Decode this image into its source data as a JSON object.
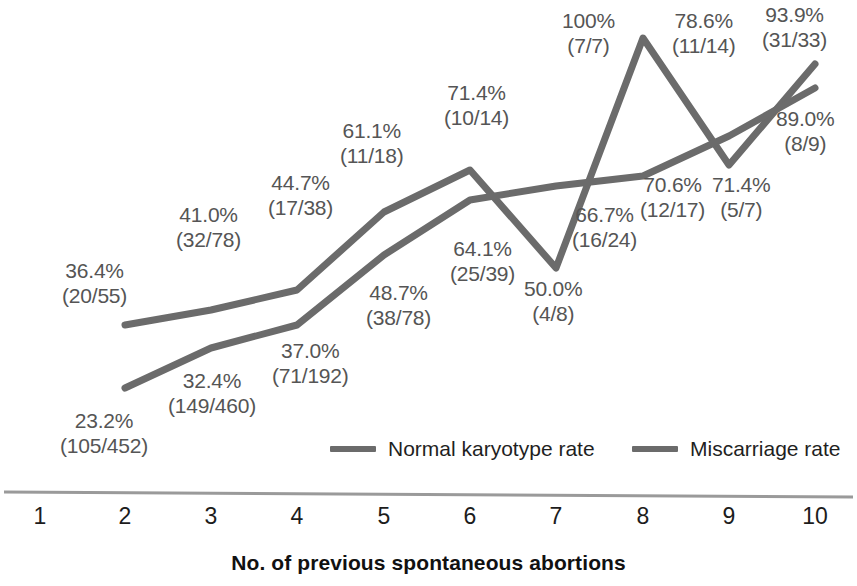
{
  "chart_data": {
    "type": "line",
    "title": "",
    "xlabel": "No. of previous spontaneous abortions",
    "ylabel": "",
    "grid": false,
    "legend_position": "bottom-center",
    "x": [
      1,
      2,
      3,
      4,
      5,
      6,
      7,
      8,
      9,
      10
    ],
    "xtick_labels": [
      "1",
      "2",
      "3",
      "4",
      "5",
      "6",
      "7",
      "8",
      "9",
      "10"
    ],
    "xlim": [
      1,
      10
    ],
    "ylim": [
      0,
      100
    ],
    "series": [
      {
        "name": "Miscarriage rate",
        "color": "#6b6b6b",
        "x": [
          2,
          3,
          4,
          5,
          6,
          7,
          8,
          9,
          10
        ],
        "values": [
          36.4,
          41.0,
          44.7,
          61.1,
          71.4,
          50.0,
          100.0,
          71.4,
          93.9
        ],
        "fractions": [
          "(20/55)",
          "(32/78)",
          "(17/38)",
          "(11/18)",
          "(10/14)",
          "(4/8)",
          "(7/7)",
          "(5/7)",
          "(31/33)"
        ],
        "percent_labels": [
          "36.4%",
          "41.0%",
          "44.7%",
          "61.1%",
          "71.4%",
          "50.0%",
          "100%",
          "71.4%",
          "93.9%"
        ]
      },
      {
        "name": "Normal karyotype rate",
        "color": "#6b6b6b",
        "x": [
          2,
          3,
          4,
          5,
          6,
          7,
          8,
          9,
          10
        ],
        "values": [
          23.2,
          32.4,
          37.0,
          48.7,
          64.1,
          66.7,
          70.6,
          78.6,
          89.0
        ],
        "fractions": [
          "(105/452)",
          "(149/460)",
          "(71/192)",
          "(38/78)",
          "(25/39)",
          "(16/24)",
          "(12/17)",
          "(11/14)",
          "(8/9)"
        ],
        "percent_labels": [
          "23.2%",
          "32.4%",
          "37.0%",
          "48.7%",
          "64.1%",
          "66.7%",
          "70.6%",
          "78.6%",
          "89.0%"
        ]
      }
    ],
    "annotations": [
      {
        "id": "a-36-4",
        "pct": "36.4%",
        "frac": "(20/55)",
        "x": 62,
        "y": 258
      },
      {
        "id": "a-23-2",
        "pct": "23.2%",
        "frac": "(105/452)",
        "x": 60,
        "y": 408
      },
      {
        "id": "a-41-0",
        "pct": "41.0%",
        "frac": "(32/78)",
        "x": 176,
        "y": 202
      },
      {
        "id": "a-32-4",
        "pct": "32.4%",
        "frac": "(149/460)",
        "x": 168,
        "y": 368
      },
      {
        "id": "a-44-7",
        "pct": "44.7%",
        "frac": "(17/38)",
        "x": 268,
        "y": 170
      },
      {
        "id": "a-37-0",
        "pct": "37.0%",
        "frac": "(71/192)",
        "x": 272,
        "y": 338
      },
      {
        "id": "a-61-1",
        "pct": "61.1%",
        "frac": "(11/18)",
        "x": 340,
        "y": 118
      },
      {
        "id": "a-48-7",
        "pct": "48.7%",
        "frac": "(38/78)",
        "x": 366,
        "y": 280
      },
      {
        "id": "a-71-4a",
        "pct": "71.4%",
        "frac": "(10/14)",
        "x": 444,
        "y": 80
      },
      {
        "id": "a-64-1",
        "pct": "64.1%",
        "frac": "(25/39)",
        "x": 450,
        "y": 236
      },
      {
        "id": "a-50-0",
        "pct": "50.0%",
        "frac": "(4/8)",
        "x": 524,
        "y": 276
      },
      {
        "id": "a-100",
        "pct": "100%",
        "frac": "(7/7)",
        "x": 562,
        "y": 8
      },
      {
        "id": "a-66-7",
        "pct": "66.7%",
        "frac": "(16/24)",
        "x": 572,
        "y": 202
      },
      {
        "id": "a-70-6",
        "pct": "70.6%",
        "frac": "(12/17)",
        "x": 640,
        "y": 172
      },
      {
        "id": "a-78-6",
        "pct": "78.6%",
        "frac": "(11/14)",
        "x": 672,
        "y": 8
      },
      {
        "id": "a-71-4b",
        "pct": "71.4%",
        "frac": "(5/7)",
        "x": 712,
        "y": 172
      },
      {
        "id": "a-93-9",
        "pct": "93.9%",
        "frac": "(31/33)",
        "x": 762,
        "y": 2
      },
      {
        "id": "a-89-0",
        "pct": "89.0%",
        "frac": "(8/9)",
        "x": 776,
        "y": 106
      }
    ]
  },
  "axis": {
    "title": "No. of previous spontaneous abortions",
    "ticks": [
      {
        "label": "1",
        "px": 40
      },
      {
        "label": "2",
        "px": 125
      },
      {
        "label": "3",
        "px": 211
      },
      {
        "label": "4",
        "px": 297
      },
      {
        "label": "5",
        "px": 384
      },
      {
        "label": "6",
        "px": 470
      },
      {
        "label": "7",
        "px": 556
      },
      {
        "label": "8",
        "px": 643
      },
      {
        "label": "9",
        "px": 729
      },
      {
        "label": "10",
        "px": 815
      }
    ]
  },
  "legend": {
    "items": [
      {
        "label": "Normal karyotype rate",
        "color": "#6b6b6b",
        "x": 330,
        "y": 437
      },
      {
        "label": "Miscarriage rate",
        "color": "#6b6b6b",
        "x": 632,
        "y": 437
      }
    ]
  },
  "colors": {
    "line": "#6b6b6b",
    "label_text": "#555555",
    "tick_text": "#1c1c1c",
    "axis_line": "#9a9a9a",
    "background": "#ffffff"
  }
}
